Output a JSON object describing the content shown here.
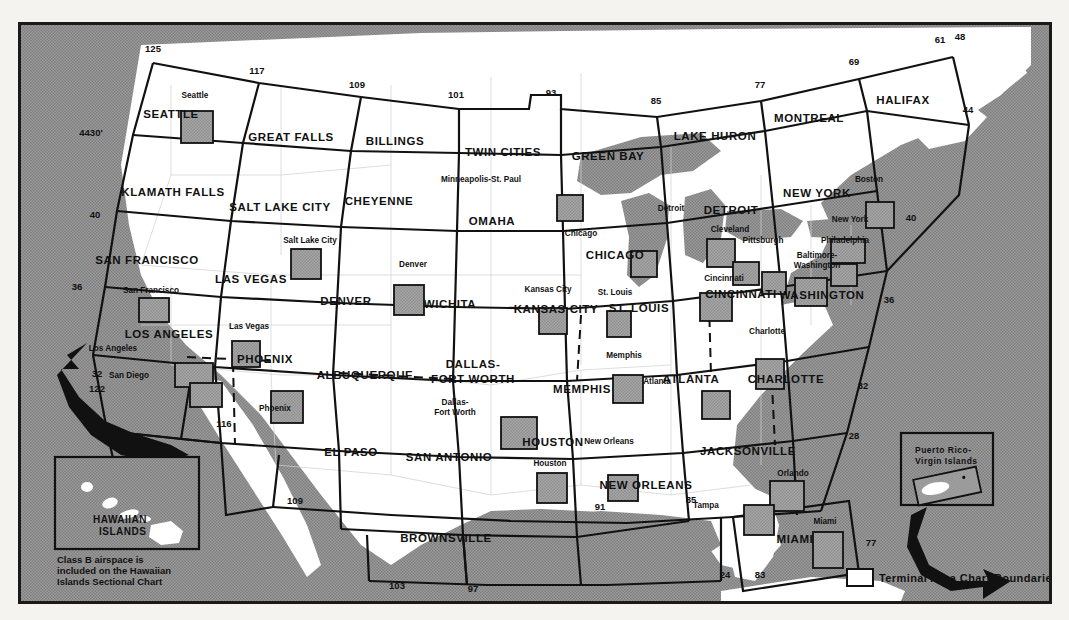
{
  "chart_data": {
    "type": "map",
    "ocean_color": "#8d8d8d",
    "land_color": "#ffffff",
    "tac_box_color": "#9a9a9a",
    "line_color": "#111111",
    "sectional_charts": [
      {
        "name": "SEATTLE",
        "x": 168,
        "y": 118
      },
      {
        "name": "GREAT FALLS",
        "x": 288,
        "y": 141
      },
      {
        "name": "BILLINGS",
        "x": 392,
        "y": 145
      },
      {
        "name": "TWIN CITIES",
        "x": 500,
        "y": 156
      },
      {
        "name": "GREEN BAY",
        "x": 605,
        "y": 160
      },
      {
        "name": "LAKE HURON",
        "x": 712,
        "y": 140
      },
      {
        "name": "MONTREAL",
        "x": 806,
        "y": 122
      },
      {
        "name": "HALIFAX",
        "x": 900,
        "y": 104
      },
      {
        "name": "KLAMATH FALLS",
        "x": 170,
        "y": 196
      },
      {
        "name": "SALT LAKE CITY",
        "x": 277,
        "y": 211
      },
      {
        "name": "CHEYENNE",
        "x": 376,
        "y": 205
      },
      {
        "name": "OMAHA",
        "x": 489,
        "y": 225
      },
      {
        "name": "CHICAGO",
        "x": 612,
        "y": 259
      },
      {
        "name": "DETROIT",
        "x": 728,
        "y": 214
      },
      {
        "name": "NEW YORK",
        "x": 814,
        "y": 197
      },
      {
        "name": "SAN FRANCISCO",
        "x": 144,
        "y": 264
      },
      {
        "name": "LAS VEGAS",
        "x": 248,
        "y": 283
      },
      {
        "name": "DENVER",
        "x": 343,
        "y": 305
      },
      {
        "name": "WICHITA",
        "x": 447,
        "y": 308
      },
      {
        "name": "KANSAS CITY",
        "x": 553,
        "y": 313
      },
      {
        "name": "ST. LOUIS",
        "x": 636,
        "y": 312
      },
      {
        "name": "CINCINNATI",
        "x": 738,
        "y": 298
      },
      {
        "name": "WASHINGTON",
        "x": 819,
        "y": 299
      },
      {
        "name": "LOS ANGELES",
        "x": 166,
        "y": 338
      },
      {
        "name": "PHOENIX",
        "x": 262,
        "y": 363
      },
      {
        "name": "ALBUQUERQUE",
        "x": 362,
        "y": 379
      },
      {
        "name": "DALLAS-",
        "x": 470,
        "y": 368
      },
      {
        "name": "FORT WORTH",
        "x": 470,
        "y": 383
      },
      {
        "name": "MEMPHIS",
        "x": 579,
        "y": 393
      },
      {
        "name": "ATLANTA",
        "x": 688,
        "y": 383
      },
      {
        "name": "CHARLOTTE",
        "x": 783,
        "y": 383
      },
      {
        "name": "EL PASO",
        "x": 348,
        "y": 456
      },
      {
        "name": "SAN ANTONIO",
        "x": 446,
        "y": 461
      },
      {
        "name": "HOUSTON",
        "x": 550,
        "y": 446
      },
      {
        "name": "NEW ORLEANS",
        "x": 643,
        "y": 489
      },
      {
        "name": "JACKSONVILLE",
        "x": 745,
        "y": 455
      },
      {
        "name": "BROWNSVILLE",
        "x": 443,
        "y": 542
      },
      {
        "name": "MIAMI",
        "x": 792,
        "y": 543
      }
    ],
    "terminal_area_cities": [
      {
        "name": "Seattle",
        "lx": 192,
        "ly": 98,
        "bx": 160,
        "by": 90,
        "bw": 30,
        "bh": 30
      },
      {
        "name": "Minneapolis-St. Paul",
        "lx": 478,
        "ly": 182,
        "bx": 538,
        "by": 172,
        "bw": 24,
        "bh": 24
      },
      {
        "name": "Chicago",
        "lx": 578,
        "ly": 236,
        "bx": 612,
        "by": 228,
        "bw": 24,
        "bh": 24
      },
      {
        "name": "Detroit",
        "lx": 668,
        "ly": 211,
        "bx": 688,
        "by": 216,
        "bw": 26,
        "bh": 26
      },
      {
        "name": "Cleveland",
        "lx": 727,
        "ly": 232,
        "bx": 713,
        "by": 238,
        "bw": 24,
        "bh": 22
      },
      {
        "name": "Pittsburgh",
        "lx": 760,
        "ly": 243,
        "bx": 742,
        "by": 248,
        "bw": 22,
        "bh": 20
      },
      {
        "name": "Boston",
        "lx": 866,
        "ly": 182,
        "bx": 846,
        "by": 179,
        "bw": 26,
        "bh": 24
      },
      {
        "name": "New York",
        "lx": 847,
        "ly": 222,
        "bx": 812,
        "by": 216,
        "bw": 32,
        "bh": 22
      },
      {
        "name": "Philadelphia",
        "lx": 842,
        "ly": 243,
        "bx": 812,
        "by": 240,
        "bw": 24,
        "bh": 20
      },
      {
        "name": "Baltimore-",
        "lx": 814,
        "ly": 258,
        "bx": 776,
        "by": 255,
        "bw": 30,
        "bh": 26
      },
      {
        "name": "Washington",
        "lx": 814,
        "ly": 268,
        "bx": 0,
        "by": 0,
        "bw": 0,
        "bh": 0
      },
      {
        "name": "Salt Lake City",
        "lx": 307,
        "ly": 243,
        "bx": 272,
        "by": 226,
        "bw": 28,
        "bh": 28
      },
      {
        "name": "Denver",
        "lx": 410,
        "ly": 267,
        "bx": 375,
        "by": 262,
        "bw": 28,
        "bh": 28
      },
      {
        "name": "San Francisco",
        "lx": 148,
        "ly": 293,
        "bx": 120,
        "by": 275,
        "bw": 28,
        "bh": 22
      },
      {
        "name": "Las Vegas",
        "lx": 246,
        "ly": 329,
        "bx": 213,
        "by": 318,
        "bw": 26,
        "bh": 24
      },
      {
        "name": "Los Angeles",
        "lx": 110,
        "ly": 351,
        "bx": 156,
        "by": 340,
        "bw": 36,
        "bh": 22
      },
      {
        "name": "San Diego",
        "lx": 126,
        "ly": 378,
        "bx": 171,
        "by": 360,
        "bw": 30,
        "bh": 22
      },
      {
        "name": "Phoenix",
        "lx": 272,
        "ly": 411,
        "bx": 252,
        "by": 368,
        "bw": 30,
        "bh": 30
      },
      {
        "name": "Kansas City",
        "lx": 545,
        "ly": 292,
        "bx": 520,
        "by": 285,
        "bw": 26,
        "bh": 24
      },
      {
        "name": "St. Louis",
        "lx": 612,
        "ly": 295,
        "bx": 588,
        "by": 288,
        "bw": 22,
        "bh": 24
      },
      {
        "name": "Cincinnati",
        "lx": 721,
        "ly": 281,
        "bx": 681,
        "by": 270,
        "bw": 30,
        "bh": 26
      },
      {
        "name": "Charlotte",
        "lx": 764,
        "ly": 334,
        "bx": 737,
        "by": 336,
        "bw": 26,
        "bh": 28
      },
      {
        "name": "Memphis",
        "lx": 621,
        "ly": 358,
        "bx": 594,
        "by": 352,
        "bw": 28,
        "bh": 26
      },
      {
        "name": "Atlanta",
        "lx": 654,
        "ly": 384,
        "bx": 683,
        "by": 368,
        "bw": 26,
        "bh": 26
      },
      {
        "name": "Dallas-",
        "lx": 452,
        "ly": 405,
        "bx": 482,
        "by": 394,
        "bw": 34,
        "bh": 30
      },
      {
        "name": "Fort Worth",
        "lx": 452,
        "ly": 415,
        "bx": 0,
        "by": 0,
        "bw": 0,
        "bh": 0
      },
      {
        "name": "Houston",
        "lx": 547,
        "ly": 466,
        "bx": 518,
        "by": 450,
        "bw": 28,
        "bh": 28
      },
      {
        "name": "New Orleans",
        "lx": 606,
        "ly": 444,
        "bx": 589,
        "by": 452,
        "bw": 28,
        "bh": 24
      },
      {
        "name": "Orlando",
        "lx": 790,
        "ly": 476,
        "bx": 751,
        "by": 458,
        "bw": 32,
        "bh": 28
      },
      {
        "name": "Tampa",
        "lx": 703,
        "ly": 508,
        "bx": 725,
        "by": 482,
        "bw": 28,
        "bh": 28
      },
      {
        "name": "Miami",
        "lx": 822,
        "ly": 524,
        "bx": 794,
        "by": 509,
        "bw": 28,
        "bh": 34
      }
    ],
    "longitude_labels": [
      {
        "value": "125",
        "x": 150,
        "y": 52
      },
      {
        "value": "117",
        "x": 254,
        "y": 74
      },
      {
        "value": "109",
        "x": 354,
        "y": 88
      },
      {
        "value": "101",
        "x": 453,
        "y": 98
      },
      {
        "value": "93",
        "x": 548,
        "y": 96
      },
      {
        "value": "85",
        "x": 653,
        "y": 104
      },
      {
        "value": "77",
        "x": 757,
        "y": 88
      },
      {
        "value": "69",
        "x": 851,
        "y": 65
      },
      {
        "value": "61",
        "x": 937,
        "y": 43
      },
      {
        "value": "122",
        "x": 94,
        "y": 392
      },
      {
        "value": "116",
        "x": 221,
        "y": 427
      },
      {
        "value": "109",
        "x": 292,
        "y": 504
      },
      {
        "value": "103",
        "x": 394,
        "y": 589
      },
      {
        "value": "97",
        "x": 470,
        "y": 592
      },
      {
        "value": "91",
        "x": 597,
        "y": 510
      },
      {
        "value": "85",
        "x": 688,
        "y": 503
      },
      {
        "value": "83",
        "x": 757,
        "y": 578
      },
      {
        "value": "77",
        "x": 868,
        "y": 546
      }
    ],
    "latitude_labels": [
      {
        "value": "4430'",
        "x": 88,
        "y": 136
      },
      {
        "value": "40",
        "x": 92,
        "y": 218
      },
      {
        "value": "36",
        "x": 74,
        "y": 290
      },
      {
        "value": "32",
        "x": 94,
        "y": 377
      },
      {
        "value": "48",
        "x": 957,
        "y": 40
      },
      {
        "value": "44",
        "x": 965,
        "y": 113
      },
      {
        "value": "40",
        "x": 908,
        "y": 221
      },
      {
        "value": "36",
        "x": 886,
        "y": 303
      },
      {
        "value": "32",
        "x": 860,
        "y": 389
      },
      {
        "value": "28",
        "x": 851,
        "y": 439
      },
      {
        "value": "24",
        "x": 722,
        "y": 578
      }
    ],
    "hawaii_inset": {
      "title_line1": "HAWAIIAN",
      "title_line2": "ISLANDS",
      "note_line1": "Class B airspace is",
      "note_line2": "included on the Hawaiian",
      "note_line3": "Islands Sectional Chart"
    },
    "puerto_rico_inset": {
      "title_line1": "Puerto Rico-",
      "title_line2": "Virgin Islands"
    },
    "legend": {
      "label": "Terminal Area Chart Boundaries"
    }
  }
}
